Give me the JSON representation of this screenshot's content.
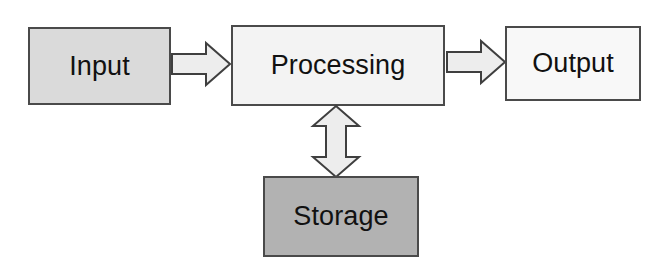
{
  "diagram": {
    "background_color": "#ffffff",
    "nodes": [
      {
        "id": "input",
        "label": "Input",
        "fill_color": "#dadada",
        "border_color": "#4a4a4a"
      },
      {
        "id": "processing",
        "label": "Processing",
        "fill_color": "#f3f3f3",
        "border_color": "#4a4a4a"
      },
      {
        "id": "output",
        "label": "Output",
        "fill_color": "#f8f8f8",
        "border_color": "#4a4a4a"
      },
      {
        "id": "storage",
        "label": "Storage",
        "fill_color": "#b2b2b2",
        "border_color": "#4a4a4a"
      }
    ],
    "connectors": [
      {
        "id": "input-to-processing",
        "from": "input",
        "to": "processing",
        "direction": "right",
        "bidirectional": false,
        "fill_color": "#ededed",
        "stroke_color": "#3f3f3f"
      },
      {
        "id": "processing-to-output",
        "from": "processing",
        "to": "output",
        "direction": "right",
        "bidirectional": false,
        "fill_color": "#ededed",
        "stroke_color": "#3f3f3f"
      },
      {
        "id": "processing-to-storage",
        "from": "processing",
        "to": "storage",
        "direction": "vertical",
        "bidirectional": true,
        "fill_color": "#ededed",
        "stroke_color": "#3f3f3f"
      }
    ]
  }
}
